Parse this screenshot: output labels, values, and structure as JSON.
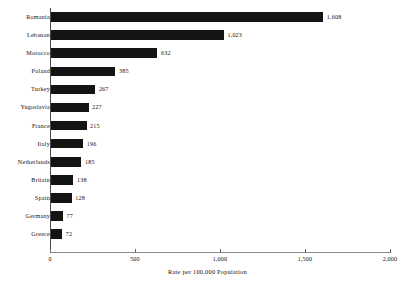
{
  "chart_data": {
    "type": "bar",
    "orientation": "horizontal",
    "title": "",
    "xlabel": "Rate per 100,000 Population",
    "ylabel": "",
    "xlim": [
      0,
      2000
    ],
    "xticks": [
      0,
      500,
      1000,
      1500,
      2000
    ],
    "xtick_labels": [
      "0",
      "500",
      "1,000",
      "1,500",
      "2,000"
    ],
    "grid": false,
    "legend": null,
    "bar_color": "#141414",
    "background": "#ffffff",
    "categories": [
      "Romania",
      "Lebanon",
      "Morocco",
      "Poland",
      "Turkey",
      "Yugoslavia",
      "France",
      "Italy",
      "Netherlands",
      "Britain",
      "Spain",
      "Germany",
      "Greece"
    ],
    "values": [
      1608,
      1023,
      632,
      385,
      267,
      227,
      215,
      196,
      185,
      138,
      128,
      77,
      72
    ],
    "value_labels": [
      "1,608",
      "1,023",
      "632",
      "385",
      "267",
      "227",
      "215",
      "196",
      "185",
      "138",
      "128",
      "77",
      "72"
    ]
  }
}
